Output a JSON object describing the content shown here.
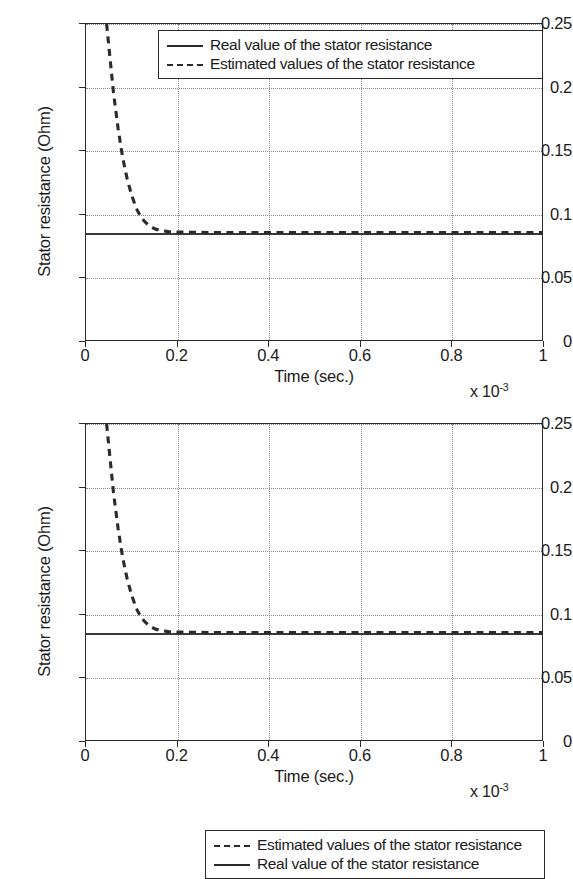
{
  "chart_data": [
    {
      "id": "top",
      "type": "line",
      "title": "",
      "xlabel": "Time (sec.)",
      "ylabel": "Stator resistance (Ohm)",
      "x_exponent_label": "x 10",
      "x_exponent_power": "-3",
      "xlim": [
        0,
        1
      ],
      "ylim": [
        0,
        0.25
      ],
      "xticks": [
        "0",
        "0.2",
        "0.4",
        "0.6",
        "0.8",
        "1"
      ],
      "xtick_values": [
        0,
        0.2,
        0.4,
        0.6,
        0.8,
        1
      ],
      "yticks": [
        "0",
        "0.05",
        "0.1",
        "0.15",
        "0.2",
        "0.25"
      ],
      "ytick_values": [
        0,
        0.05,
        0.1,
        0.15,
        0.2,
        0.25
      ],
      "grid": true,
      "legend_position": "top-right",
      "legend_entries": [
        {
          "label": "Real value of the stator resistance",
          "style": "solid"
        },
        {
          "label": "Estimated values of the stator resistance",
          "style": "dashed"
        }
      ],
      "series": [
        {
          "name": "Real value of the stator resistance",
          "style": "solid",
          "constant_value": 0.086,
          "x": [
            0,
            1
          ],
          "values": [
            0.086,
            0.086
          ]
        },
        {
          "name": "Estimated values of the stator resistance",
          "style": "dashed",
          "x": [
            0.045,
            0.05,
            0.06,
            0.07,
            0.08,
            0.09,
            0.1,
            0.11,
            0.12,
            0.13,
            0.14,
            0.15,
            0.16,
            0.18,
            0.2,
            0.3,
            0.5,
            0.7,
            1
          ],
          "values": [
            0.25,
            0.232,
            0.196,
            0.168,
            0.145,
            0.128,
            0.115,
            0.105,
            0.098,
            0.094,
            0.091,
            0.089,
            0.0878,
            0.0868,
            0.0864,
            0.086,
            0.086,
            0.086,
            0.086
          ]
        }
      ]
    },
    {
      "id": "bottom",
      "type": "line",
      "title": "",
      "xlabel": "Time (sec.)",
      "ylabel": "Stator resistance (Ohm)",
      "x_exponent_label": "x 10",
      "x_exponent_power": "-3",
      "xlim": [
        0,
        1
      ],
      "ylim": [
        0,
        0.25
      ],
      "xticks": [
        "0",
        "0.2",
        "0.4",
        "0.6",
        "0.8",
        "1"
      ],
      "xtick_values": [
        0,
        0.2,
        0.4,
        0.6,
        0.8,
        1
      ],
      "yticks": [
        "0",
        "0.05",
        "0.1",
        "0.15",
        "0.2",
        "0.25"
      ],
      "ytick_values": [
        0,
        0.05,
        0.1,
        0.15,
        0.2,
        0.25
      ],
      "grid": true,
      "legend_position": "top-right",
      "legend_entries": [
        {
          "label": "Estimated values of the stator resistance",
          "style": "dashed"
        },
        {
          "label": "Real value of the stator resistance",
          "style": "solid"
        }
      ],
      "series": [
        {
          "name": "Estimated values of the stator resistance",
          "style": "dashed",
          "x": [
            0.045,
            0.05,
            0.06,
            0.07,
            0.08,
            0.09,
            0.1,
            0.11,
            0.12,
            0.13,
            0.14,
            0.15,
            0.16,
            0.18,
            0.2,
            0.3,
            0.5,
            0.7,
            1
          ],
          "values": [
            0.25,
            0.232,
            0.196,
            0.168,
            0.145,
            0.128,
            0.115,
            0.105,
            0.098,
            0.094,
            0.091,
            0.089,
            0.0878,
            0.0868,
            0.0864,
            0.086,
            0.086,
            0.086,
            0.086
          ]
        },
        {
          "name": "Real value of the stator resistance",
          "style": "solid",
          "constant_value": 0.086,
          "x": [
            0,
            1
          ],
          "values": [
            0.086,
            0.086
          ]
        }
      ]
    }
  ]
}
